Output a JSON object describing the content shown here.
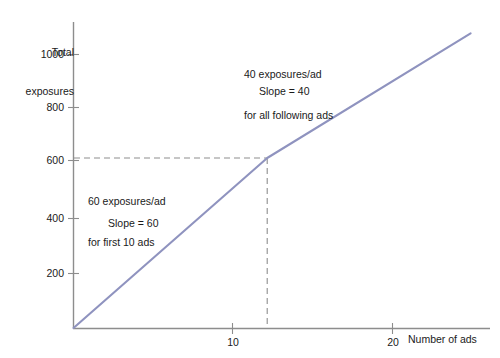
{
  "chart_data": {
    "type": "line",
    "title": "",
    "subtitle": "",
    "xlabel": "Number of ads",
    "ylabel": "Total exposures",
    "xlim": [
      0,
      21.5
    ],
    "ylim": [
      0,
      1080
    ],
    "grid": false,
    "legend": "none",
    "x_ticks": [
      10,
      20
    ],
    "x_tick_labels": [
      "10",
      "20"
    ],
    "y_ticks": [
      200,
      400,
      600,
      800,
      1000
    ],
    "y_tick_labels": [
      "200",
      "400",
      "600",
      "800",
      "1000"
    ],
    "series": [
      {
        "name": "Total exposures",
        "color": "#8f93bf",
        "x": [
          0,
          10,
          20.5
        ],
        "values": [
          0,
          600,
          1040
        ],
        "breakpoints": [
          {
            "x": 10,
            "y": 600,
            "label": "kink"
          }
        ]
      }
    ],
    "reference_lines": [
      {
        "orientation": "horizontal",
        "value": 600,
        "style": "dashed",
        "from_x": 0,
        "to_x": 10
      },
      {
        "orientation": "vertical",
        "value": 10,
        "style": "dashed",
        "from_y": 0,
        "to_y": 600
      }
    ],
    "annotations": [
      {
        "text": "60 exposures/ad\nfor first 10 ads",
        "x": 1.0,
        "y": 560
      },
      {
        "text": "Slope = 60",
        "x": 2.2,
        "y": 380
      },
      {
        "text": "40 exposures/ad\nfor all following ads",
        "x": 10.8,
        "y": 1060
      },
      {
        "text": "Slope = 40",
        "x": 11.7,
        "y": 900
      }
    ]
  },
  "axes": {
    "y_title_line1": "Total",
    "y_title_line2": "exposures",
    "x_title": "Number of ads",
    "y_tick_1000": "1000",
    "y_tick_800": "800",
    "y_tick_600": "600",
    "y_tick_400": "400",
    "y_tick_200": "200",
    "x_tick_10": "10",
    "x_tick_20": "20"
  },
  "annotations": {
    "slope60_line1": "60 exposures/ad",
    "slope60_line2": "for first 10 ads",
    "slope60_value": "Slope = 60",
    "slope40_line1": "40 exposures/ad",
    "slope40_line2": "for all following ads",
    "slope40_value": "Slope = 40"
  },
  "colors": {
    "line": "#8f93bf",
    "axis": "#8d8d8d",
    "dashed": "#8d8d8d",
    "text": "#1a1a1a",
    "background": "#ffffff"
  }
}
